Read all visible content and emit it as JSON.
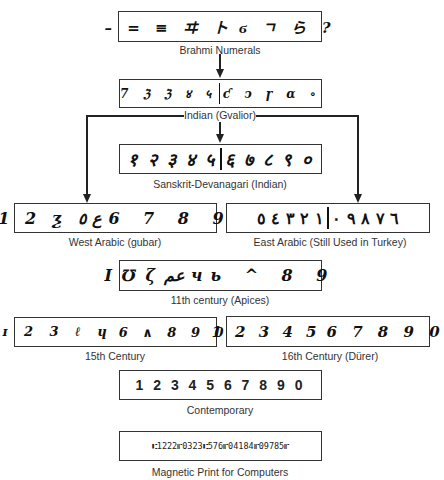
{
  "diagram": {
    "nodes": [
      {
        "id": "brahmi",
        "label": "Brahmi Numerals",
        "left_digits": "– = ≡ ヰ ト",
        "right_digits": "ϭ ㄱ ら ?"
      },
      {
        "id": "indian",
        "label": "Indian (Gvalior)",
        "left_digits": "7 ℨ ℨ ४ ५",
        "right_digits": "ƈ ↄ ɼ ɑ ∘"
      },
      {
        "id": "sanskrit",
        "label": "Sanskrit-Devanagari (Indian)",
        "left_digits": "१ २ ३ ४ ५",
        "right_digits": "६ ७ ८ ९ ०"
      },
      {
        "id": "west_arabic",
        "label": "West Arabic (gubar)",
        "left_digits": "1 2 ƺ ع ٥",
        "right_digits": "6 7 8 9"
      },
      {
        "id": "east_arabic",
        "label": "East Arabic (Still Used in Turkey)",
        "left_digits": "١ ٢ ٣ ٤ ٥",
        "right_digits": "٦ ٧ ٨ ٩ ٠"
      },
      {
        "id": "apices",
        "label": "11th century (Apices)",
        "left_digits": "I ℧ ζ عم ч",
        "right_digits": "ь ^ 8 9"
      },
      {
        "id": "c15",
        "label": "15th Century",
        "left_digits": "ɪ 2 3 ℓ ɥ",
        "right_digits": "6 ∧ 8 9 0"
      },
      {
        "id": "c16",
        "label": "16th Century (Dürer)",
        "left_digits": "1 2 3 4 5",
        "right_digits": "6 7 8 9 0"
      },
      {
        "id": "contemporary",
        "label": "Contemporary",
        "digits": "1 2 3 4 5 6 7 8 9 0"
      },
      {
        "id": "magnetic",
        "label": "Magnetic Print for Computers",
        "digits": "⑆1222⑈0323⑆576⑈04184⑈09785⑈"
      }
    ],
    "edges": [
      {
        "from": "brahmi",
        "to": "indian"
      },
      {
        "from": "indian",
        "to": "sanskrit"
      },
      {
        "from": "indian",
        "to": "west_arabic"
      },
      {
        "from": "indian",
        "to": "east_arabic"
      }
    ]
  }
}
